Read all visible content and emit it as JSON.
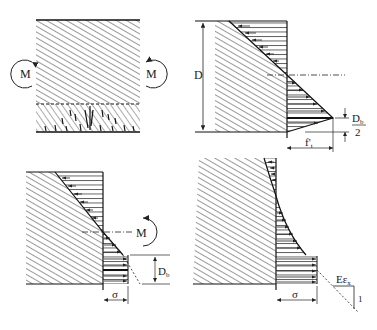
{
  "figure": {
    "panels": [
      {
        "id": "beam-cracked",
        "labels": {
          "moment_left": "M",
          "moment_right": "M"
        }
      },
      {
        "id": "linear-stress-distribution",
        "labels": {
          "depth": "D",
          "db_num": "D",
          "db_sub": "b",
          "db_den": "2",
          "tensile": "f'",
          "tensile_sub": "t"
        }
      },
      {
        "id": "stress-block-moment",
        "labels": {
          "moment": "M",
          "db": "D",
          "db_sub": "b",
          "sigma": "σ"
        }
      },
      {
        "id": "nonlinear-stress-distribution",
        "labels": {
          "sigma": "σ",
          "e_eps": "Eε",
          "e_eps_sub": "x",
          "slope": "1"
        }
      }
    ]
  }
}
